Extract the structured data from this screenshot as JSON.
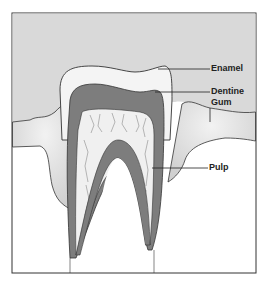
{
  "diagram": {
    "labels": {
      "enamel": "Enamel",
      "dentine": "Dentine",
      "gum": "Gum",
      "pulp": "Pulp"
    },
    "colors": {
      "background_gray": "#d9d9d9",
      "enamel": "#f4f4f4",
      "dentine": "#7d7d7d",
      "pulp": "#f0f0f0",
      "gum": "#ececec",
      "outline": "#222222"
    }
  }
}
